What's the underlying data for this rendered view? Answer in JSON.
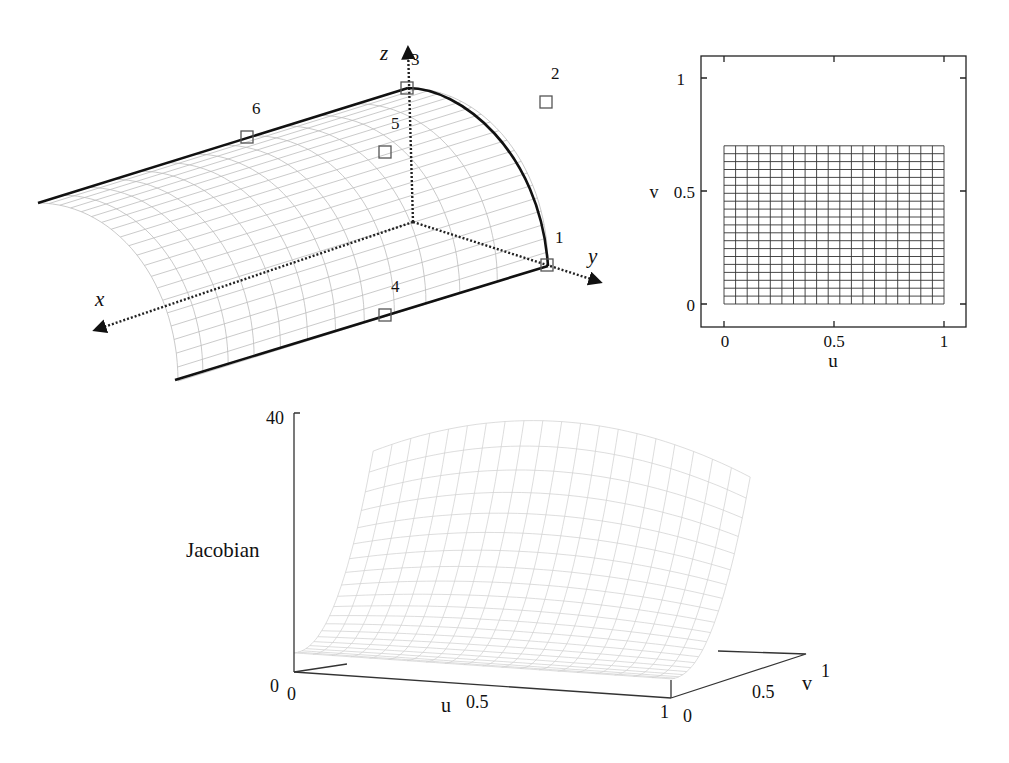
{
  "surface_plot": {
    "axes": {
      "x": "x",
      "y": "y",
      "z": "z"
    },
    "control_points": [
      {
        "id": "1",
        "label": "1"
      },
      {
        "id": "2",
        "label": "2"
      },
      {
        "id": "3",
        "label": "3"
      },
      {
        "id": "4",
        "label": "4"
      },
      {
        "id": "5",
        "label": "5"
      },
      {
        "id": "6",
        "label": "6"
      }
    ]
  },
  "parameter_plot": {
    "xlabel": "u",
    "ylabel": "v",
    "xticks": [
      "0",
      "0.5",
      "1"
    ],
    "yticks": [
      "0",
      "0.5",
      "1"
    ],
    "grid": {
      "u_range": [
        0,
        1
      ],
      "v_range": [
        0,
        0.7
      ],
      "u_divisions": 19,
      "v_divisions": 20
    }
  },
  "jacobian_plot": {
    "zlabel": "Jacobian",
    "zticks": [
      "0",
      "40"
    ],
    "uaxis": {
      "label": "u",
      "ticks": [
        "0",
        "0.5",
        "1"
      ]
    },
    "vaxis": {
      "label": "v",
      "ticks": [
        "0",
        "0.5",
        "1"
      ]
    }
  },
  "chart_data": [
    {
      "type": "surface",
      "title": "",
      "description": "Quarter-cylinder rational surface with 6 labelled control points",
      "axes": [
        "x",
        "y",
        "z"
      ],
      "control_point_labels": [
        "1",
        "2",
        "3",
        "4",
        "5",
        "6"
      ]
    },
    {
      "type": "mesh",
      "title": "",
      "xlabel": "u",
      "ylabel": "v",
      "xlim": [
        -0.1,
        1.1
      ],
      "ylim": [
        -0.1,
        1.1
      ],
      "xticks": [
        0,
        0.5,
        1
      ],
      "yticks": [
        0,
        0.5,
        1
      ],
      "grid_extent": {
        "u": [
          0,
          1
        ],
        "v": [
          0,
          0.7
        ]
      }
    },
    {
      "type": "surface",
      "title": "",
      "xlabel": "u",
      "ylabel": "v",
      "zlabel": "Jacobian",
      "xlim": [
        0,
        1
      ],
      "ylim": [
        0,
        1
      ],
      "zlim": [
        0,
        40
      ],
      "zticks": [
        0,
        40
      ],
      "notes": "Jacobian near ~3 at v=0, rising steeply to ~40 at v≈0.7; slightly peaked at u=0.5"
    }
  ]
}
